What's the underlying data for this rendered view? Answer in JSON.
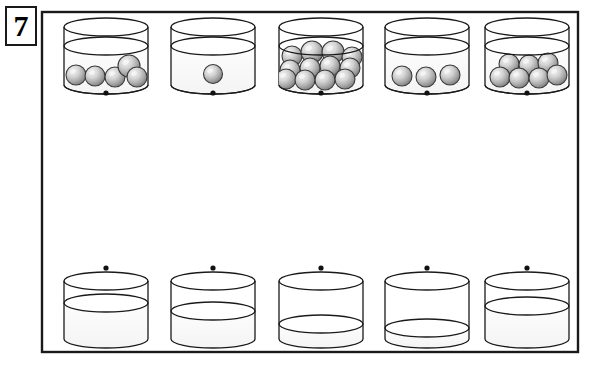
{
  "exercise": {
    "number_label": "7",
    "frame": {
      "x": 42,
      "y": 12,
      "width": 536,
      "height": 340
    }
  },
  "palette": {
    "outline": "#1a1a1a",
    "water_fill": "#fbfbfb",
    "glass_fill": "#ffffff",
    "ball_light": "#e8e8e8",
    "ball_mid": "#b8b8b8",
    "ball_dark": "#777777",
    "ball_outline": "#3a3a3a",
    "dot": "#111111",
    "page_background": "#ffffff"
  },
  "geometry": {
    "top_row": {
      "cylinder_width": 84,
      "rim_rx": 42,
      "rim_ry": 9,
      "top_y": 27,
      "bottom_y": 85,
      "water_y": 46
    },
    "bottom_row": {
      "cylinder_width": 84,
      "rim_rx": 42,
      "rim_ry": 9,
      "top_y": 281,
      "bottom_y": 339
    },
    "dot_radius": 2.6,
    "top_dot_y": 93,
    "bottom_dot_y": 268,
    "column_centers": [
      106,
      213,
      321,
      427,
      527
    ]
  },
  "top_row": {
    "label": "cylinders-with-marbles",
    "cylinders": [
      {
        "id": "top-cylinder-1",
        "marble_count": 5,
        "water_level_y": 46,
        "marbles": [
          {
            "cx": 76,
            "cy": 75,
            "r": 10
          },
          {
            "cx": 95,
            "cy": 76,
            "r": 10
          },
          {
            "cx": 115,
            "cy": 77,
            "r": 10
          },
          {
            "cx": 129,
            "cy": 66,
            "r": 11
          },
          {
            "cx": 137,
            "cy": 77,
            "r": 10
          }
        ]
      },
      {
        "id": "top-cylinder-2",
        "marble_count": 1,
        "water_level_y": 46,
        "marbles": [
          {
            "cx": 213,
            "cy": 74,
            "r": 9.5
          }
        ]
      },
      {
        "id": "top-cylinder-3",
        "marble_count": 12,
        "water_level_y": 46,
        "marbles": [
          {
            "cx": 292,
            "cy": 56,
            "r": 10
          },
          {
            "cx": 312,
            "cy": 52,
            "r": 11
          },
          {
            "cx": 333,
            "cy": 52,
            "r": 11
          },
          {
            "cx": 352,
            "cy": 57,
            "r": 10
          },
          {
            "cx": 290,
            "cy": 70,
            "r": 10
          },
          {
            "cx": 310,
            "cy": 68,
            "r": 10
          },
          {
            "cx": 330,
            "cy": 66,
            "r": 10
          },
          {
            "cx": 350,
            "cy": 68,
            "r": 10
          },
          {
            "cx": 286,
            "cy": 79,
            "r": 10
          },
          {
            "cx": 305,
            "cy": 80,
            "r": 10
          },
          {
            "cx": 325,
            "cy": 80,
            "r": 10
          },
          {
            "cx": 345,
            "cy": 79,
            "r": 10
          }
        ]
      },
      {
        "id": "top-cylinder-4",
        "marble_count": 3,
        "water_level_y": 46,
        "marbles": [
          {
            "cx": 402,
            "cy": 76,
            "r": 10
          },
          {
            "cx": 426,
            "cy": 77,
            "r": 10
          },
          {
            "cx": 450,
            "cy": 75,
            "r": 10
          }
        ]
      },
      {
        "id": "top-cylinder-5",
        "marble_count": 7,
        "water_level_y": 46,
        "marbles": [
          {
            "cx": 509,
            "cy": 64,
            "r": 10
          },
          {
            "cx": 529,
            "cy": 65,
            "r": 10
          },
          {
            "cx": 548,
            "cy": 63,
            "r": 10
          },
          {
            "cx": 500,
            "cy": 77,
            "r": 10
          },
          {
            "cx": 519,
            "cy": 78,
            "r": 10
          },
          {
            "cx": 539,
            "cy": 78,
            "r": 10
          },
          {
            "cx": 557,
            "cy": 75,
            "r": 10
          }
        ]
      }
    ]
  },
  "bottom_row": {
    "label": "empty-cylinders-with-water-levels",
    "cylinders": [
      {
        "id": "bottom-cylinder-1",
        "water_level_y": 303
      },
      {
        "id": "bottom-cylinder-2",
        "water_level_y": 311
      },
      {
        "id": "bottom-cylinder-3",
        "water_level_y": 324
      },
      {
        "id": "bottom-cylinder-4",
        "water_level_y": 328
      },
      {
        "id": "bottom-cylinder-5",
        "water_level_y": 306
      }
    ]
  }
}
